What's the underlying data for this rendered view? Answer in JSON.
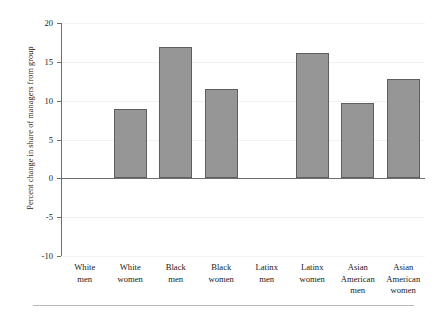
{
  "chart_data": {
    "type": "bar",
    "title": "",
    "xlabel": "",
    "ylabel": "Percent change in share of managers from group",
    "ylim": [
      -10,
      20
    ],
    "yticks": [
      20,
      15,
      10,
      5,
      0,
      -5,
      -10
    ],
    "ytick_labels": [
      "20",
      "15",
      "10",
      "5",
      "0",
      "-5",
      "-10"
    ],
    "grid": true,
    "legend": "none",
    "categories": [
      "White men",
      "White women",
      "Black men",
      "Black women",
      "Latinx men",
      "Latinx women",
      "Asian American men",
      "Asian American women"
    ],
    "category_lines": [
      [
        "White",
        "men"
      ],
      [
        "White",
        "women"
      ],
      [
        "Black",
        "men"
      ],
      [
        "Black",
        "women"
      ],
      [
        "Latinx",
        "men"
      ],
      [
        "Latinx",
        "women"
      ],
      [
        "Asian",
        "American",
        "men"
      ],
      [
        "Asian",
        "American",
        "women"
      ]
    ],
    "values": [
      0,
      8.9,
      16.9,
      11.5,
      0,
      16.1,
      9.6,
      12.8
    ],
    "bar_color": "#969696",
    "bar_edge_color": "#5e5e5e",
    "axis_color": "#6e6e6e",
    "grid_color": "#f2f2f2"
  }
}
